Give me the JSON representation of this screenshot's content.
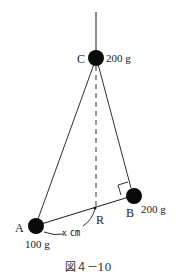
{
  "figure": {
    "caption": "図４－10",
    "points": {
      "C": {
        "label": "C",
        "mass": "200 g"
      },
      "B": {
        "label": "B",
        "mass": "200 g"
      },
      "A": {
        "label": "A",
        "mass": "100 g"
      },
      "R": {
        "label": "R"
      }
    },
    "distance_label": "x ㎝",
    "colors": {
      "line": "#1a1a1a",
      "ball": "#0a0a0a",
      "background": "#ffffff"
    }
  }
}
